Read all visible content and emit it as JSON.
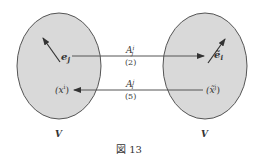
{
  "figure": {
    "caption": "図 13",
    "colors": {
      "ellipse_fill": "#d9d9d9",
      "ellipse_stroke": "#555555",
      "line": "#444444",
      "text": "#333333"
    }
  },
  "left_space": {
    "label": "V",
    "basis_vector": "e",
    "basis_index": "j",
    "component": "(x",
    "component_sup": "i",
    "component_close": ")"
  },
  "right_space": {
    "label": "V",
    "basis_vector": "ẽ",
    "basis_index": "i",
    "component": "(x̃",
    "component_sup": "j",
    "component_close": ")"
  },
  "arrows": [
    {
      "direction": "left-to-right",
      "label": "A",
      "label_sup": "i",
      "label_sub": "j",
      "equation_ref": "(2)"
    },
    {
      "direction": "right-to-left",
      "label": "A",
      "label_sup": "j",
      "label_sub": "i",
      "equation_ref": "(5)"
    }
  ]
}
